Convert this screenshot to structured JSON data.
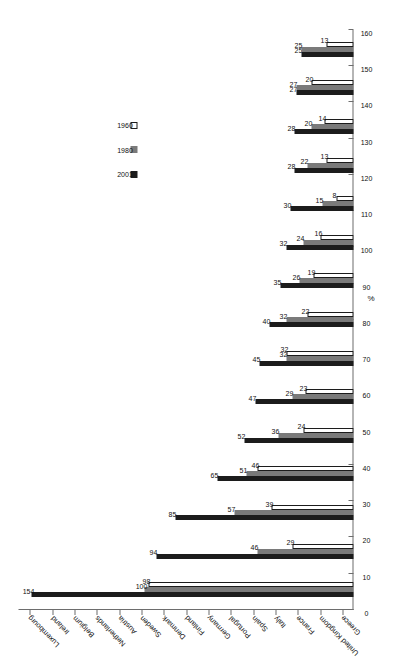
{
  "chart_data": {
    "type": "bar",
    "title": "",
    "xlabel": "",
    "ylabel": "%",
    "ylim": [
      0,
      160
    ],
    "ytick_step": 10,
    "grid": false,
    "orientation": "vertical-rotated-90ccw",
    "legend_position": "upper-center",
    "categories": [
      "Luxembourg",
      "Ireland",
      "Belgium",
      "Netherlands",
      "Austria",
      "Sweden",
      "Denmark",
      "Finland",
      "Germany",
      "Portugal",
      "Spain",
      "Italy",
      "France",
      "United Kingdom",
      "Greece"
    ],
    "yticks": [
      0,
      10,
      20,
      30,
      40,
      50,
      60,
      70,
      80,
      90,
      100,
      110,
      120,
      130,
      140,
      150,
      160
    ],
    "series": [
      {
        "name": "2001",
        "color": "#1c1c1c",
        "values": [
          154,
          94,
          85,
          65,
          52,
          47,
          45,
          40,
          35,
          32,
          30,
          28,
          28,
          27,
          25
        ]
      },
      {
        "name": "1980",
        "color": "#7a7a7a",
        "values": [
          100,
          46,
          57,
          51,
          36,
          29,
          32,
          32,
          26,
          24,
          15,
          22,
          20,
          27,
          25
        ]
      },
      {
        "name": "1960",
        "color": "#ffffff",
        "values": [
          98,
          29,
          39,
          46,
          24,
          23,
          32,
          22,
          19,
          16,
          8,
          13,
          14,
          20,
          13
        ]
      }
    ]
  },
  "legend": {
    "items": [
      {
        "label": "2001",
        "series": "s2001"
      },
      {
        "label": "1980",
        "series": "s1980"
      },
      {
        "label": "1960",
        "series": "s1960"
      }
    ]
  },
  "axis": {
    "unit_label": "%"
  }
}
